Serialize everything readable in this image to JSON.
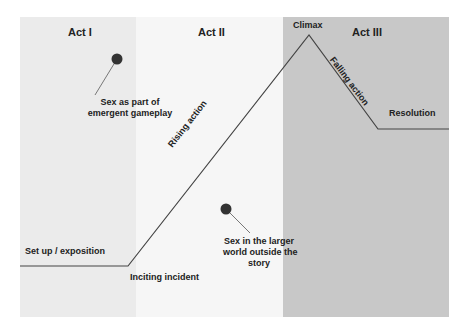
{
  "acts": [
    {
      "label": "Act I",
      "color": "#ebebeb"
    },
    {
      "label": "Act II",
      "color": "#f6f6f6"
    },
    {
      "label": "Act III",
      "color": "#c8c8c8"
    }
  ],
  "plot_points": {
    "setup": "Set up / exposition",
    "inciting": "Inciting incident",
    "rising": "Rising action",
    "climax": "Climax",
    "falling": "Falling action",
    "resolution": "Resolution"
  },
  "annotations": [
    {
      "line1": "Sex as part of",
      "line2": "emergent gameplay"
    },
    {
      "line1": "Sex in the larger",
      "line2": "world outside the",
      "line3": "story"
    }
  ],
  "colors": {
    "line": "#444444",
    "dot": "#333333",
    "text": "#222222"
  }
}
